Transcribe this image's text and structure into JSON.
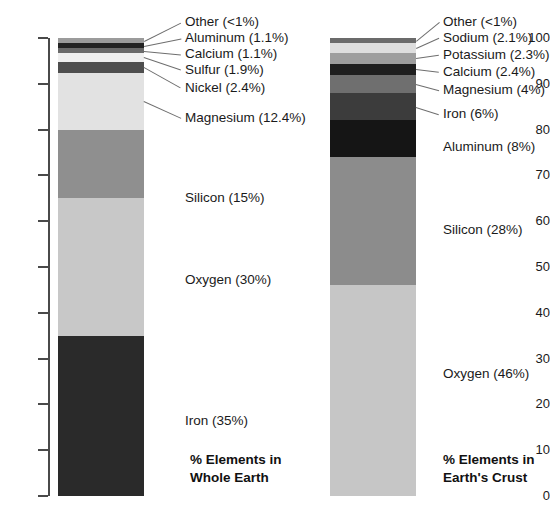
{
  "chart_data": {
    "type": "bar",
    "title": "",
    "subtitle": "",
    "xlabel": "",
    "ylabel": "",
    "ylim": [
      0,
      100
    ],
    "grid": false,
    "legend": "none",
    "stacked": true,
    "orientation": "vertical",
    "axis_ticks": [
      "100",
      "90",
      "80",
      "70",
      "60",
      "50",
      "40",
      "30",
      "20",
      "10",
      "0"
    ],
    "axis_tick_values": [
      100,
      90,
      80,
      70,
      60,
      50,
      40,
      30,
      20,
      10,
      0
    ],
    "categories": [
      "Whole Earth",
      "Earth's Crust"
    ],
    "series": [
      {
        "name": "Whole Earth",
        "caption_line1": "% Elements in",
        "caption_line2": "Whole Earth",
        "segments": [
          {
            "label": "Iron",
            "pct": "35%",
            "value": 35,
            "text": "Iron (35%)",
            "color": "#2a2a2a",
            "placement": "inside"
          },
          {
            "label": "Oxygen",
            "pct": "30%",
            "value": 30,
            "text": "Oxygen (30%)",
            "color": "#c8c8c8",
            "placement": "inside"
          },
          {
            "label": "Silicon",
            "pct": "15%",
            "value": 15,
            "text": "Silicon (15%)",
            "color": "#8f8f8f",
            "placement": "inside"
          },
          {
            "label": "Magnesium",
            "pct": "12.4%",
            "value": 12.4,
            "text": "Magnesium (12.4%)",
            "color": "#e2e2e2",
            "placement": "leader"
          },
          {
            "label": "Nickel",
            "pct": "2.4%",
            "value": 2.4,
            "text": "Nickel (2.4%)",
            "color": "#4e4e4e",
            "placement": "leader"
          },
          {
            "label": "Sulfur",
            "pct": "1.9%",
            "value": 1.9,
            "text": "Sulfur (1.9%)",
            "color": "#efefef",
            "placement": "leader"
          },
          {
            "label": "Calcium",
            "pct": "1.1%",
            "value": 1.1,
            "text": "Calcium (1.1%)",
            "color": "#6a6a6a",
            "placement": "leader"
          },
          {
            "label": "Aluminum",
            "pct": "1.1%",
            "value": 1.1,
            "text": "Aluminum (1.1%)",
            "color": "#232323",
            "placement": "leader"
          },
          {
            "label": "Other",
            "pct": "<1%",
            "value": 1.1,
            "text": "Other (<1%)",
            "color": "#9b9b9b",
            "placement": "leader"
          }
        ]
      },
      {
        "name": "Earth's Crust",
        "caption_line1": "% Elements in",
        "caption_line2": "Earth's Crust",
        "segments": [
          {
            "label": "Oxygen",
            "pct": "46%",
            "value": 46,
            "text": "Oxygen (46%)",
            "color": "#c6c6c6",
            "placement": "inside"
          },
          {
            "label": "Silicon",
            "pct": "28%",
            "value": 28,
            "text": "Silicon (28%)",
            "color": "#8c8c8c",
            "placement": "inside"
          },
          {
            "label": "Aluminum",
            "pct": "8%",
            "value": 8,
            "text": "Aluminum (8%)",
            "color": "#151515",
            "placement": "inside"
          },
          {
            "label": "Iron",
            "pct": "6%",
            "value": 6,
            "text": "Iron (6%)",
            "color": "#3c3c3c",
            "placement": "leader"
          },
          {
            "label": "Magnesium",
            "pct": "4%",
            "value": 4,
            "text": "Magnesium (4%)",
            "color": "#6f6f6f",
            "placement": "leader"
          },
          {
            "label": "Calcium",
            "pct": "2.4%",
            "value": 2.4,
            "text": "Calcium (2.4%)",
            "color": "#1f1f1f",
            "placement": "leader"
          },
          {
            "label": "Potassium",
            "pct": "2.3%",
            "value": 2.3,
            "text": "Potassium (2.3%)",
            "color": "#9e9e9e",
            "placement": "leader"
          },
          {
            "label": "Sodium",
            "pct": "2.1%",
            "value": 2.1,
            "text": "Sodium (2.1%)",
            "color": "#dedede",
            "placement": "leader"
          },
          {
            "label": "Other",
            "pct": "<1%",
            "value": 1.2,
            "text": "Other (<1%)",
            "color": "#6b6b6b",
            "placement": "leader"
          }
        ]
      }
    ],
    "callout_labels_left": [
      "Other (<1%)",
      "Aluminum (1.1%)",
      "Calcium (1.1%)",
      "Sulfur (1.9%)",
      "Nickel (2.4%)",
      "Magnesium (12.4%)"
    ],
    "callout_labels_right": [
      "Other (<1%)",
      "Sodium (2.1%)",
      "Potassium (2.3%)",
      "Calcium (2.4%)",
      "Magnesium (4%)",
      "Iron (6%)"
    ],
    "inside_labels_left": [
      "Silicon (15%)",
      "Oxygen (30%)",
      "Iron (35%)"
    ],
    "inside_labels_right": [
      "Aluminum (8%)",
      "Silicon (28%)",
      "Oxygen (46%)"
    ]
  }
}
